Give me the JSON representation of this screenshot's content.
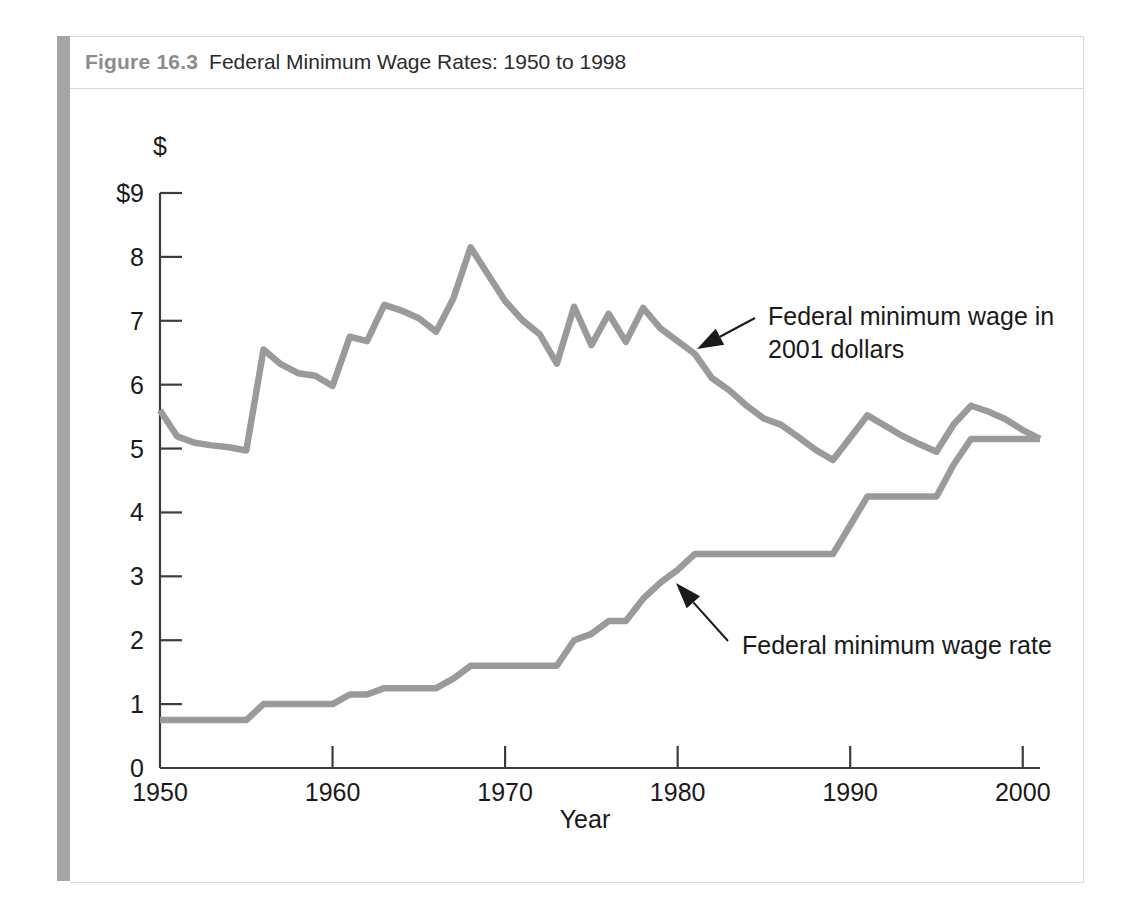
{
  "figure": {
    "number_label": "Figure 16.3",
    "title": "Federal Minimum Wage Rates: 1950 to 1998",
    "accent_color": "#a6a6a6",
    "line_color": "#9a9a9a",
    "axis_color": "#3d3d3d"
  },
  "chart_data": {
    "type": "line",
    "title": "Federal Minimum Wage Rates: 1950 to 1998",
    "xlabel": "Year",
    "ylabel": "$",
    "y_axis_unit_symbol": "$",
    "xlim": [
      1950,
      2001
    ],
    "ylim": [
      0,
      9
    ],
    "grid": false,
    "legend": "annotations",
    "x_ticks": [
      1950,
      1960,
      1970,
      1980,
      1990,
      2000
    ],
    "x_tick_labels": [
      "1950",
      "1960",
      "1970",
      "1980",
      "1990",
      "2000"
    ],
    "y_ticks": [
      0,
      1,
      2,
      3,
      4,
      5,
      6,
      7,
      8,
      9
    ],
    "y_tick_labels": [
      "0",
      "1",
      "2",
      "3",
      "4",
      "5",
      "6",
      "7",
      "8",
      "$9"
    ],
    "series": [
      {
        "name": "Federal minimum wage in 2001 dollars",
        "annotation": "Federal minimum wage in 2001 dollars",
        "x": [
          1950,
          1951,
          1952,
          1953,
          1954,
          1955,
          1956,
          1957,
          1958,
          1959,
          1960,
          1961,
          1962,
          1963,
          1964,
          1965,
          1966,
          1967,
          1968,
          1969,
          1970,
          1971,
          1972,
          1973,
          1974,
          1975,
          1976,
          1977,
          1978,
          1979,
          1980,
          1981,
          1982,
          1983,
          1984,
          1985,
          1986,
          1987,
          1988,
          1989,
          1990,
          1991,
          1992,
          1993,
          1994,
          1995,
          1996,
          1997,
          1998,
          1999,
          2000,
          2001
        ],
        "values": [
          5.6,
          5.19,
          5.09,
          5.05,
          5.02,
          4.97,
          6.55,
          6.32,
          6.18,
          6.14,
          5.98,
          6.75,
          6.68,
          7.25,
          7.16,
          7.04,
          6.83,
          7.35,
          8.15,
          7.73,
          7.31,
          7.01,
          6.79,
          6.33,
          7.22,
          6.62,
          7.11,
          6.67,
          7.2,
          6.88,
          6.68,
          6.48,
          6.1,
          5.91,
          5.67,
          5.47,
          5.37,
          5.18,
          4.98,
          4.82,
          5.17,
          5.52,
          5.36,
          5.2,
          5.07,
          4.95,
          5.38,
          5.67,
          5.58,
          5.46,
          5.29,
          5.15
        ]
      },
      {
        "name": "Federal minimum wage rate",
        "annotation": "Federal minimum wage rate",
        "x": [
          1950,
          1951,
          1952,
          1953,
          1954,
          1955,
          1956,
          1957,
          1958,
          1959,
          1960,
          1961,
          1962,
          1963,
          1964,
          1965,
          1966,
          1967,
          1968,
          1969,
          1970,
          1971,
          1972,
          1973,
          1974,
          1975,
          1976,
          1977,
          1978,
          1979,
          1980,
          1981,
          1982,
          1983,
          1984,
          1985,
          1986,
          1987,
          1988,
          1989,
          1990,
          1991,
          1992,
          1993,
          1994,
          1995,
          1996,
          1997,
          1998,
          1999,
          2000,
          2001
        ],
        "values": [
          0.75,
          0.75,
          0.75,
          0.75,
          0.75,
          0.75,
          1.0,
          1.0,
          1.0,
          1.0,
          1.0,
          1.15,
          1.15,
          1.25,
          1.25,
          1.25,
          1.25,
          1.4,
          1.6,
          1.6,
          1.6,
          1.6,
          1.6,
          1.6,
          2.0,
          2.1,
          2.3,
          2.3,
          2.65,
          2.9,
          3.1,
          3.35,
          3.35,
          3.35,
          3.35,
          3.35,
          3.35,
          3.35,
          3.35,
          3.35,
          3.8,
          4.25,
          4.25,
          4.25,
          4.25,
          4.25,
          4.75,
          5.15,
          5.15,
          5.15,
          5.15,
          5.15
        ]
      }
    ],
    "annotations": [
      {
        "id": "annot-real-wage",
        "line1": "Federal minimum wage in",
        "line2": "2001 dollars",
        "points_to_year": 1982
      },
      {
        "id": "annot-nominal-wage",
        "line1": "Federal minimum wage rate",
        "line2": "",
        "points_to_year": 1980
      }
    ]
  }
}
